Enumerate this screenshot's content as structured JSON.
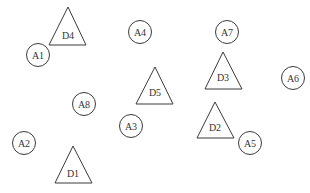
{
  "diagram": {
    "width": 310,
    "height": 193,
    "background": "#ffffff",
    "stroke_color": "#3a3a3a",
    "text_color": "#333333",
    "circle_radius": 11.5,
    "circles": [
      {
        "id": "A1",
        "label": "A1",
        "cx": 38,
        "cy": 55
      },
      {
        "id": "A2",
        "label": "A2",
        "cx": 24,
        "cy": 143
      },
      {
        "id": "A3",
        "label": "A3",
        "cx": 131,
        "cy": 126
      },
      {
        "id": "A4",
        "label": "A4",
        "cx": 140,
        "cy": 32
      },
      {
        "id": "A5",
        "label": "A5",
        "cx": 250,
        "cy": 143
      },
      {
        "id": "A6",
        "label": "A6",
        "cx": 293,
        "cy": 78
      },
      {
        "id": "A7",
        "label": "A7",
        "cx": 227,
        "cy": 32
      },
      {
        "id": "A8",
        "label": "A8",
        "cx": 84,
        "cy": 104
      }
    ],
    "triangles": [
      {
        "id": "D1",
        "label": "D1",
        "apex": [
          73,
          146
        ],
        "base_left": [
          55,
          183
        ],
        "base_right": [
          92,
          183
        ],
        "label_pos": [
          73,
          173
        ]
      },
      {
        "id": "D2",
        "label": "D2",
        "apex": [
          215,
          102
        ],
        "base_left": [
          197,
          138
        ],
        "base_right": [
          234,
          138
        ],
        "label_pos": [
          215,
          127
        ]
      },
      {
        "id": "D3",
        "label": "D3",
        "apex": [
          223,
          52
        ],
        "base_left": [
          205,
          89
        ],
        "base_right": [
          242,
          89
        ],
        "label_pos": [
          223,
          77
        ]
      },
      {
        "id": "D4",
        "label": "D4",
        "apex": [
          68,
          7
        ],
        "base_left": [
          49,
          45
        ],
        "base_right": [
          86,
          45
        ],
        "label_pos": [
          68,
          35
        ]
      },
      {
        "id": "D5",
        "label": "D5",
        "apex": [
          155,
          67
        ],
        "base_left": [
          136,
          104
        ],
        "base_right": [
          173,
          104
        ],
        "label_pos": [
          155,
          92
        ]
      }
    ]
  }
}
